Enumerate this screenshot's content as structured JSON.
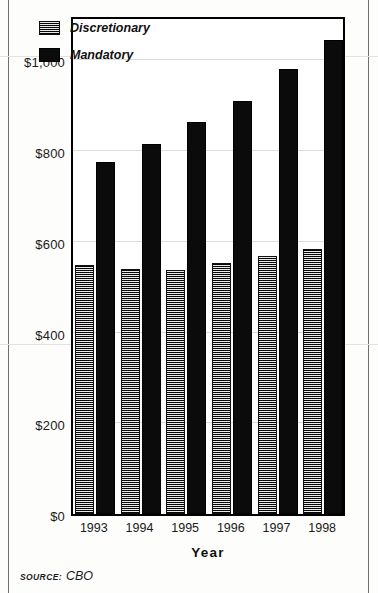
{
  "chart_data": {
    "type": "bar",
    "title": "",
    "xlabel": "Year",
    "ylabel": "",
    "categories": [
      "1993",
      "1994",
      "1995",
      "1996",
      "1997",
      "1998"
    ],
    "series": [
      {
        "name": "Discretionary",
        "values": [
          550,
          540,
          538,
          553,
          568,
          585
        ],
        "pattern": "hatched",
        "color": "#4a4a4a"
      },
      {
        "name": "Mandatory",
        "values": [
          775,
          815,
          865,
          910,
          980,
          1045
        ],
        "pattern": "solid",
        "color": "#0b0b0b"
      }
    ],
    "ylim": [
      0,
      1100
    ],
    "yticks": [
      0,
      200,
      400,
      600,
      800,
      1000
    ],
    "ytick_labels": [
      "$0",
      "$200",
      "$400",
      "$600",
      "$800",
      "$1,000"
    ],
    "grid": true,
    "legend_position": "top-left-inside"
  },
  "legend": {
    "items": [
      {
        "label": "Discretionary",
        "swatch": "hatched-gray-swatch"
      },
      {
        "label": "Mandatory",
        "swatch": "solid-black-swatch"
      }
    ]
  },
  "source": {
    "label": "SOURCE:",
    "value": "CBO"
  }
}
